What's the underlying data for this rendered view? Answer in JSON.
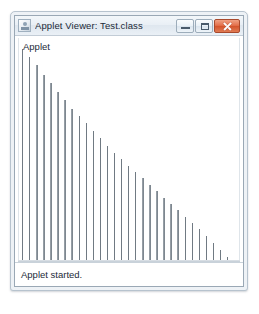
{
  "window": {
    "title": "Applet Viewer: Test.class",
    "icon": "applet-viewer-icon",
    "controls": {
      "minimize_label": "Minimize",
      "maximize_label": "Maximize",
      "close_label": "Close"
    },
    "accent_close_color": "#d4542c",
    "frame_color": "#b7c3ce"
  },
  "applet": {
    "label": "Applet",
    "background_color": "#ffffff",
    "bar_color": "#6d7780"
  },
  "status": {
    "text": "Applet started."
  },
  "chart_data": {
    "type": "bar",
    "title": "",
    "xlabel": "",
    "ylabel": "",
    "grid": false,
    "legend": null,
    "categories": [
      "1",
      "2",
      "3",
      "4",
      "5",
      "6",
      "7",
      "8",
      "9",
      "10",
      "11",
      "12",
      "13",
      "14",
      "15",
      "16",
      "17",
      "18",
      "19",
      "20",
      "21",
      "22",
      "23",
      "24",
      "25",
      "26",
      "27",
      "28",
      "29",
      "30"
    ],
    "values": [
      200,
      193,
      185,
      176,
      168,
      160,
      152,
      144,
      137,
      130,
      123,
      116,
      109,
      102,
      96,
      90,
      84,
      78,
      72,
      66,
      60,
      54,
      48,
      42,
      36,
      30,
      24,
      17,
      10,
      4
    ],
    "ylim": [
      0,
      205
    ],
    "bar_width_px": 1.4,
    "bar_spacing_px": 7.2
  }
}
